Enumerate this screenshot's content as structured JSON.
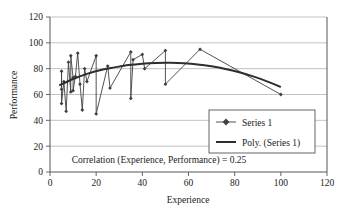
{
  "chart_data": {
    "type": "scatter",
    "title": "",
    "xlabel": "Experience",
    "ylabel": "Performance",
    "xlim": [
      0,
      120
    ],
    "ylim": [
      0,
      120
    ],
    "xticks": [
      0,
      20,
      40,
      60,
      80,
      100,
      120
    ],
    "yticks": [
      0,
      20,
      40,
      60,
      80,
      100,
      120
    ],
    "grid": "horizontal",
    "legend_position": "center-right",
    "annotation": "Correlation (Experience, Performance) = 0.25",
    "series": [
      {
        "name": "Series 1",
        "marker": "diamond-line",
        "color": "#404040",
        "points": [
          [
            5,
            64
          ],
          [
            5,
            78
          ],
          [
            5,
            53
          ],
          [
            6,
            70
          ],
          [
            7,
            47
          ],
          [
            8,
            85
          ],
          [
            9,
            62
          ],
          [
            9,
            90
          ],
          [
            10,
            73
          ],
          [
            10,
            63
          ],
          [
            11,
            74
          ],
          [
            12,
            92
          ],
          [
            13,
            68
          ],
          [
            14,
            48
          ],
          [
            15,
            80
          ],
          [
            16,
            70
          ],
          [
            20,
            90
          ],
          [
            20,
            45
          ],
          [
            25,
            82
          ],
          [
            26,
            65
          ],
          [
            35,
            93
          ],
          [
            35,
            57
          ],
          [
            36,
            87
          ],
          [
            40,
            91
          ],
          [
            41,
            80
          ],
          [
            50,
            94
          ],
          [
            50,
            68
          ],
          [
            65,
            95
          ],
          [
            100,
            60
          ]
        ]
      },
      {
        "name": "Poly. (Series 1)",
        "marker": "line",
        "color": "#2e2e2e",
        "fit_points": [
          [
            4,
            67
          ],
          [
            10,
            72
          ],
          [
            16,
            76
          ],
          [
            22,
            79
          ],
          [
            28,
            81
          ],
          [
            34,
            82.8
          ],
          [
            40,
            83.9
          ],
          [
            46,
            84.4
          ],
          [
            52,
            84.5
          ],
          [
            58,
            84.2
          ],
          [
            64,
            83.3
          ],
          [
            70,
            81.8
          ],
          [
            76,
            79.8
          ],
          [
            82,
            77.2
          ],
          [
            88,
            74.0
          ],
          [
            94,
            70.2
          ],
          [
            100,
            65.8
          ]
        ]
      }
    ],
    "legend_items": [
      {
        "label": "Series 1",
        "style": "marker-line"
      },
      {
        "label": "Poly. (Series 1)",
        "style": "line"
      }
    ]
  },
  "colors": {
    "axis": "#555555",
    "grid": "#b3b3b3",
    "series": "#404040",
    "trend": "#2e2e2e",
    "background": "#ffffff",
    "legend_border": "#555555"
  }
}
